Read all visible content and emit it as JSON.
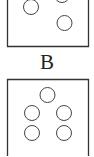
{
  "panels": [
    {
      "id": "top",
      "label": "",
      "circle_count_visible": 3
    },
    {
      "id": "bottom",
      "label": "B",
      "circle_count_visible": 5
    }
  ],
  "colors": {
    "stroke": "#333333",
    "background": "#ffffff"
  }
}
